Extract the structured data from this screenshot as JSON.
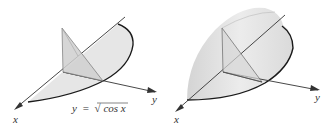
{
  "figures": [
    {
      "id": "left",
      "description": "Base region under curve with triangular cross-section slice",
      "axes": {
        "x_label": "x",
        "y_label": "y"
      },
      "curve_label": {
        "lhs": "y",
        "equals": "=",
        "radical": "√",
        "radicand": "cos x"
      }
    },
    {
      "id": "right",
      "description": "Solid formed by triangular cross-sections over the region",
      "axes": {
        "x_label": "x",
        "y_label": "y"
      }
    }
  ],
  "colors": {
    "region_fill": "#e6e6e6",
    "slice_fill": "#cfcfcf",
    "solid_fill": "#e2e2e2",
    "boundary": "#1a1a1a",
    "axis": "#333333"
  }
}
